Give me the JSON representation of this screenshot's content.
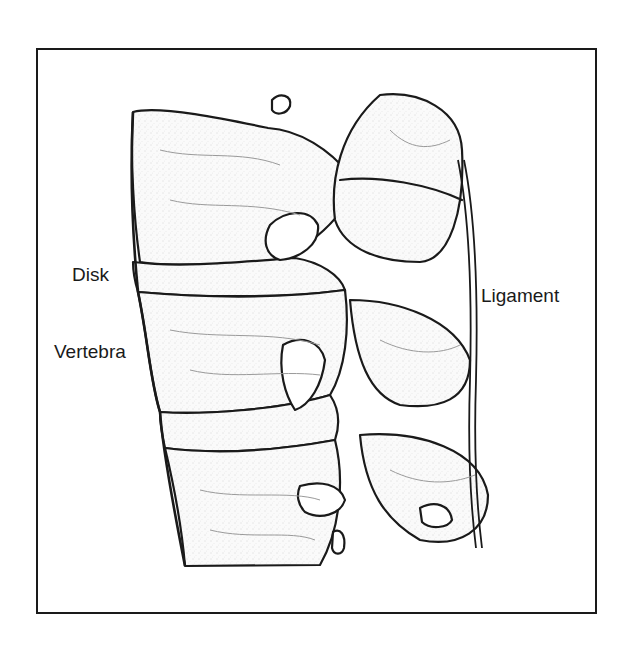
{
  "figure": {
    "labels": {
      "disk": "Disk",
      "vertebra": "Vertebra",
      "ligament": "Ligament"
    },
    "colors": {
      "line": "#1a1a1a",
      "background": "#ffffff",
      "shading": "#9a9a9a"
    }
  }
}
